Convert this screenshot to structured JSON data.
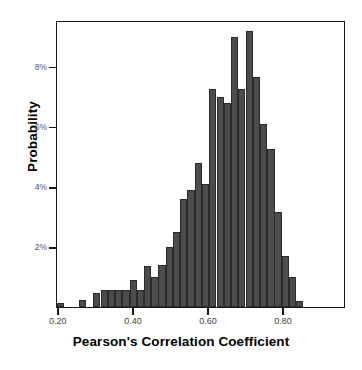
{
  "chart_data": {
    "type": "bar",
    "title": "",
    "xlabel": "Pearson's Correlation Coefficient",
    "ylabel": "Probability",
    "xlim": [
      0.195,
      0.965
    ],
    "ylim": [
      0,
      9.55
    ],
    "grid": false,
    "legend": null,
    "bin_width": 0.0193,
    "y_unit": "%",
    "xticks": [
      0.2,
      0.4,
      0.6,
      0.8
    ],
    "xtick_labels": [
      "0.20",
      "0.40",
      "0.60",
      "0.80"
    ],
    "yticks": [
      2,
      4,
      6,
      8
    ],
    "ytick_labels": [
      "2%",
      "4%",
      "6%",
      "8%"
    ],
    "bar_color": "#4c4c4c",
    "bar_edge_color": "#2b2b2b",
    "frame_color": "#1a1a1a",
    "background": "#ffffff",
    "categories": [
      "0.20",
      "0.22",
      "0.24",
      "0.26",
      "0.28",
      "0.30",
      "0.31",
      "0.33",
      "0.35",
      "0.37",
      "0.39",
      "0.41",
      "0.43",
      "0.45",
      "0.47",
      "0.49",
      "0.51",
      "0.53",
      "0.54",
      "0.56",
      "0.58",
      "0.60",
      "0.62",
      "0.64",
      "0.66",
      "0.68",
      "0.70",
      "0.72",
      "0.74",
      "0.76",
      "0.77",
      "0.79",
      "0.81",
      "0.83",
      "0.85",
      "0.87",
      "0.89",
      "0.91",
      "0.93",
      "0.95"
    ],
    "x": [
      0.205,
      0.224,
      0.244,
      0.263,
      0.282,
      0.301,
      0.321,
      0.34,
      0.359,
      0.379,
      0.398,
      0.417,
      0.437,
      0.456,
      0.475,
      0.494,
      0.514,
      0.533,
      0.552,
      0.572,
      0.591,
      0.61,
      0.63,
      0.649,
      0.668,
      0.687,
      0.707,
      0.726,
      0.745,
      0.765,
      0.784,
      0.803,
      0.823,
      0.842,
      0.861,
      0.881,
      0.9,
      0.919,
      0.938,
      0.958
    ],
    "values": [
      0.15,
      0.0,
      0.0,
      0.25,
      0.0,
      0.45,
      0.55,
      0.55,
      0.55,
      0.55,
      0.9,
      0.55,
      1.35,
      1.0,
      1.4,
      2.0,
      2.5,
      3.6,
      3.9,
      4.8,
      4.1,
      7.25,
      7.0,
      6.8,
      9.0,
      7.25,
      9.2,
      7.65,
      6.1,
      5.25,
      3.15,
      1.7,
      1.0,
      0.2,
      0.0,
      0.0,
      0.0,
      0.0,
      0.0,
      0.0
    ]
  },
  "axes": {
    "y_title": "Probability",
    "x_title": "Pearson's Correlation Coefficient"
  }
}
